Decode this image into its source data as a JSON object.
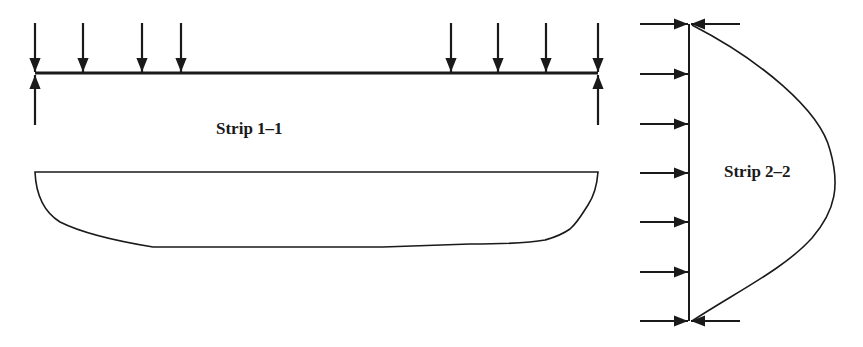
{
  "diagram": {
    "strip1": {
      "label": "Strip 1–1",
      "beam": {
        "x1": 35,
        "x2": 598,
        "y": 73
      },
      "point_loads_x": [
        35,
        83,
        142,
        181,
        451,
        498,
        546,
        598
      ],
      "supports_x": [
        35,
        598
      ],
      "moment_diagram": "convex moment diagram below beam"
    },
    "strip2": {
      "label": "Strip 2–2",
      "member": {
        "x": 689,
        "y1": 24,
        "y2": 321
      },
      "loads_y": [
        24,
        74,
        124,
        173,
        222,
        272,
        321
      ],
      "reactions_y": [
        24,
        321
      ],
      "moment_diagram": "parabolic moment curve right of member"
    },
    "colors": {
      "line": "#1a1a1a",
      "background": "#ffffff"
    }
  }
}
